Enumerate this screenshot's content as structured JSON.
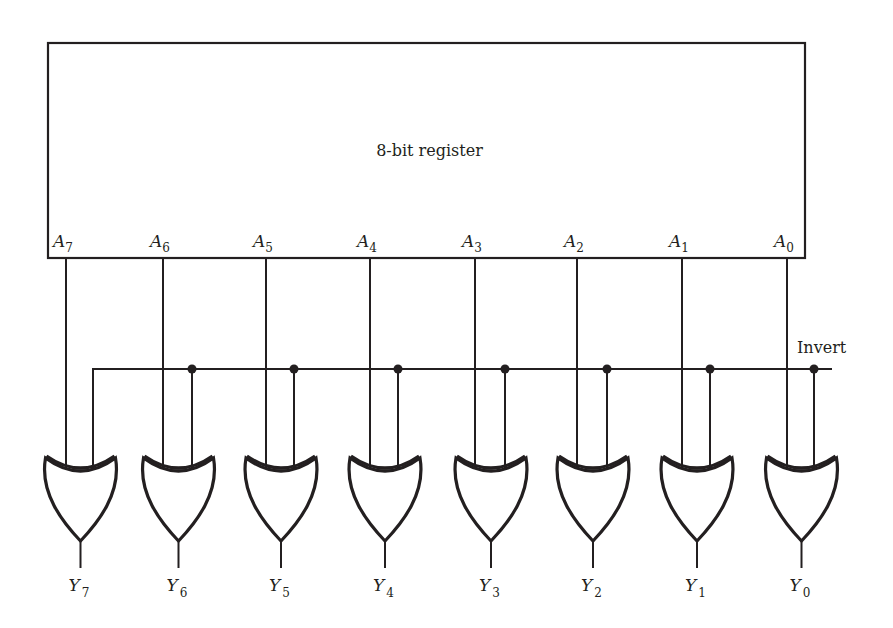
{
  "diagram": {
    "register": {
      "label": "8-bit register",
      "box": {
        "x": 48,
        "y": 43,
        "width": 757,
        "height": 215
      }
    },
    "invert_line": {
      "label": "Invert",
      "y": 369,
      "x_start": 93,
      "x_end": 832
    },
    "colors": {
      "stroke": "#231f20",
      "background": "#ffffff"
    },
    "bits": [
      {
        "index": 7,
        "input_label": "A",
        "input_sub": "7",
        "output_label": "Y",
        "output_sub": "7",
        "a_x": 66,
        "inv_x": 93,
        "has_dot": false
      },
      {
        "index": 6,
        "input_label": "A",
        "input_sub": "6",
        "output_label": "Y",
        "output_sub": "6",
        "a_x": 163,
        "inv_x": 192,
        "has_dot": true
      },
      {
        "index": 5,
        "input_label": "A",
        "input_sub": "5",
        "output_label": "Y",
        "output_sub": "5",
        "a_x": 266,
        "inv_x": 294,
        "has_dot": true
      },
      {
        "index": 4,
        "input_label": "A",
        "input_sub": "4",
        "output_label": "Y",
        "output_sub": "4",
        "a_x": 370,
        "inv_x": 398,
        "has_dot": true
      },
      {
        "index": 3,
        "input_label": "A",
        "input_sub": "3",
        "output_label": "Y",
        "output_sub": "3",
        "a_x": 475,
        "inv_x": 505,
        "has_dot": true
      },
      {
        "index": 2,
        "input_label": "A",
        "input_sub": "2",
        "output_label": "Y",
        "output_sub": "2",
        "a_x": 577,
        "inv_x": 607,
        "has_dot": true
      },
      {
        "index": 1,
        "input_label": "A",
        "input_sub": "1",
        "output_label": "Y",
        "output_sub": "1",
        "a_x": 682,
        "inv_x": 710,
        "has_dot": true
      },
      {
        "index": 0,
        "input_label": "A",
        "input_sub": "0",
        "output_label": "Y",
        "output_sub": "0",
        "a_x": 787,
        "inv_x": 814,
        "has_dot": true
      }
    ],
    "gate_type": "XOR"
  }
}
